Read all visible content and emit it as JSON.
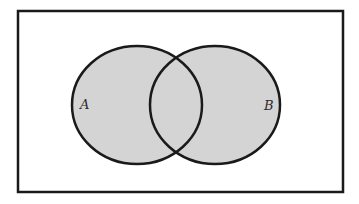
{
  "diagram": {
    "type": "venn",
    "universe": {
      "x": 18,
      "y": 11,
      "width": 325,
      "height": 181,
      "stroke": "#1a1a1a",
      "stroke_width": 2.5,
      "fill": "#ffffff"
    },
    "sets": [
      {
        "id": "A",
        "label": "A",
        "cx": 137,
        "cy": 105,
        "rx": 65,
        "ry": 59,
        "label_x": 80,
        "label_y": 109,
        "fill": "#d4d4d4",
        "stroke": "#1a1a1a",
        "stroke_width": 2.5
      },
      {
        "id": "B",
        "label": "B",
        "cx": 215,
        "cy": 105,
        "rx": 65,
        "ry": 59,
        "label_x": 264,
        "label_y": 110,
        "fill": "#d4d4d4",
        "stroke": "#1a1a1a",
        "stroke_width": 2.5
      }
    ],
    "shaded_region": "A ∪ B"
  }
}
